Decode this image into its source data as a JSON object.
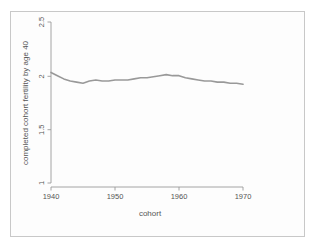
{
  "chart_data": {
    "type": "line",
    "title": "",
    "subtitle": "",
    "xlabel": "cohort",
    "ylabel": "completed cohort fertility by age 40",
    "xlim": [
      1938,
      1972
    ],
    "ylim": [
      1.0,
      2.5
    ],
    "xticks": [
      1940,
      1950,
      1960,
      1970
    ],
    "xtick_labels": [
      "1940",
      "1950",
      "1960",
      "1970"
    ],
    "yticks": [
      1,
      1.5,
      2,
      2.5
    ],
    "ytick_labels": [
      "1",
      "1.5",
      "2",
      "2.5"
    ],
    "grid": false,
    "legend": false,
    "legend_position": "none",
    "line_color": "#999999",
    "line_width": 1.6,
    "axis_color": "#9a9a9a",
    "text_color": "#555555",
    "background": "#ffffff",
    "axis_style": "detached-l-axes",
    "ylabel_rotation": 90,
    "ytick_label_rotation": 90,
    "series": [
      {
        "name": "completed cohort fertility by age 40",
        "x": [
          1940,
          1941,
          1942,
          1943,
          1944,
          1945,
          1946,
          1947,
          1948,
          1949,
          1950,
          1951,
          1952,
          1953,
          1954,
          1955,
          1956,
          1957,
          1958,
          1959,
          1960,
          1961,
          1962,
          1963,
          1964,
          1965,
          1966,
          1967,
          1968,
          1969,
          1970
        ],
        "values": [
          2.03,
          2.0,
          1.97,
          1.95,
          1.94,
          1.93,
          1.95,
          1.96,
          1.95,
          1.95,
          1.96,
          1.96,
          1.96,
          1.97,
          1.98,
          1.98,
          1.99,
          2.0,
          2.01,
          2.0,
          2.0,
          1.98,
          1.97,
          1.96,
          1.95,
          1.95,
          1.94,
          1.94,
          1.93,
          1.93,
          1.92
        ]
      }
    ]
  },
  "axes": {
    "x_title": "cohort",
    "y_title": "completed cohort fertility by age 40",
    "x_tick_1": "1940",
    "x_tick_2": "1950",
    "x_tick_3": "1960",
    "x_tick_4": "1970",
    "y_tick_1": "1",
    "y_tick_2": "1.5",
    "y_tick_3": "2",
    "y_tick_4": "2.5"
  }
}
